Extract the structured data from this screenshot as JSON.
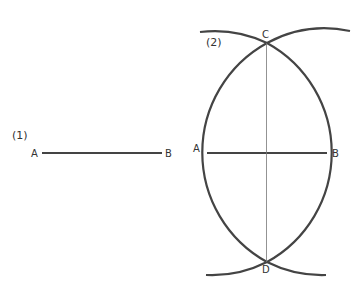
{
  "figure": {
    "step1": {
      "label": "(1)",
      "point_a": "A",
      "point_b": "B"
    },
    "step2": {
      "label": "(2)",
      "point_a": "A",
      "point_b": "B",
      "point_c": "C",
      "point_d": "D"
    }
  },
  "colors": {
    "stroke": "#444444",
    "thin_line": "#777777",
    "text": "#333333"
  }
}
